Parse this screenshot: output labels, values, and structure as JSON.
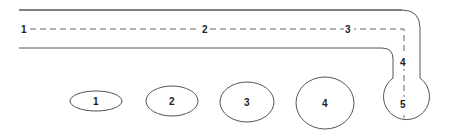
{
  "diagram": {
    "path_labels": [
      "1",
      "2",
      "3",
      "4",
      "5"
    ],
    "ellipse_labels": [
      "1",
      "2",
      "3",
      "4"
    ],
    "stroke_color": "#555555",
    "text_color": "#222222"
  }
}
